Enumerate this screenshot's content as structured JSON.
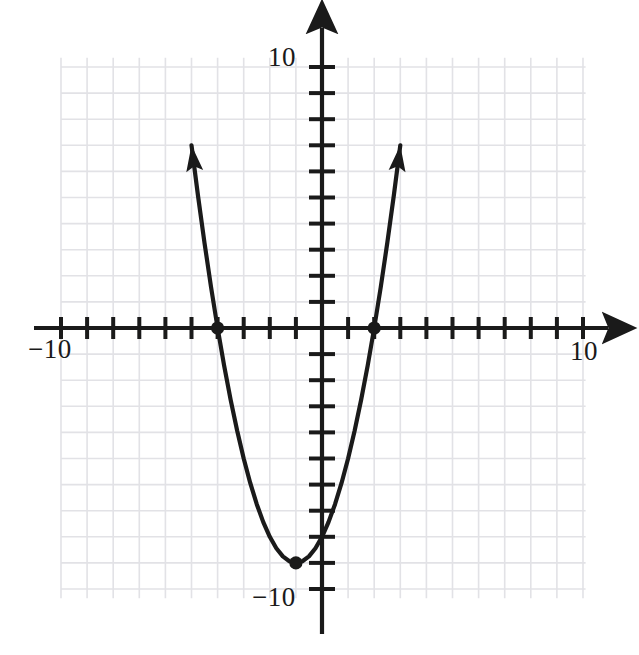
{
  "figure": {
    "background_color": "#ffffff",
    "ink_color": "#1a1a1a",
    "grid_color": "#e2e2e6"
  },
  "axis_labels": {
    "y_top": "10",
    "y_bottom": "−10",
    "x_left": "−10",
    "x_right": "10"
  },
  "chart_data": {
    "type": "line",
    "title": "",
    "xlabel": "",
    "ylabel": "",
    "xlim": [
      -10,
      10
    ],
    "ylim": [
      -10,
      10
    ],
    "grid": true,
    "legend": "none",
    "xticks": [
      -10,
      -9,
      -8,
      -7,
      -6,
      -5,
      -4,
      -3,
      -2,
      -1,
      0,
      1,
      2,
      3,
      4,
      5,
      6,
      7,
      8,
      9,
      10
    ],
    "yticks": [
      -10,
      -9,
      -8,
      -7,
      -6,
      -5,
      -4,
      -3,
      -2,
      -1,
      0,
      1,
      2,
      3,
      4,
      5,
      6,
      7,
      8,
      9,
      10
    ],
    "xtick_labels": [
      "−10",
      "10"
    ],
    "ytick_labels": [
      "−10",
      "10"
    ],
    "equation": "y = x^2 + 2x - 8",
    "vertex": [
      -1,
      -9
    ],
    "roots": [
      -4,
      2
    ],
    "series": [
      {
        "name": "parabola",
        "color": "#1a1a1a",
        "x": [
          -5.0,
          -4.75,
          -4.5,
          -4.25,
          -4.0,
          -3.75,
          -3.5,
          -3.25,
          -3.0,
          -2.75,
          -2.5,
          -2.25,
          -2.0,
          -1.75,
          -1.5,
          -1.25,
          -1.0,
          -0.75,
          -0.5,
          -0.25,
          0.0,
          0.25,
          0.5,
          0.75,
          1.0,
          1.25,
          1.5,
          1.75,
          2.0,
          2.25,
          2.5,
          2.75,
          3.0
        ],
        "y": [
          7.0,
          5.0625,
          3.25,
          1.5625,
          0.0,
          -1.4375,
          -2.75,
          -3.9375,
          -5.0,
          -5.9375,
          -6.75,
          -7.4375,
          -8.0,
          -8.4375,
          -8.75,
          -8.9375,
          -9.0,
          -8.9375,
          -8.75,
          -8.4375,
          -8.0,
          -7.4375,
          -6.75,
          -5.9375,
          -5.0,
          -3.9375,
          -2.75,
          -1.4375,
          0.0,
          1.5625,
          3.25,
          5.0625,
          7.0
        ]
      }
    ],
    "marked_points": [
      {
        "name": "root-left",
        "x": -4,
        "y": 0
      },
      {
        "name": "root-right",
        "x": 2,
        "y": 0
      },
      {
        "name": "vertex",
        "x": -1,
        "y": -9
      }
    ],
    "arrowheads": [
      {
        "name": "left-arm-arrow",
        "x": -5.0,
        "y": 7.0,
        "direction": "up-left"
      },
      {
        "name": "right-arm-arrow",
        "x": 3.0,
        "y": 7.0,
        "direction": "up-right"
      }
    ]
  }
}
